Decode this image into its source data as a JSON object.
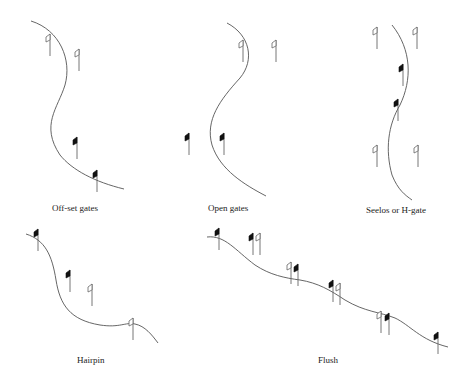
{
  "figure": {
    "panels": [
      {
        "id": "offset",
        "caption": "Off-set gates"
      },
      {
        "id": "open",
        "caption": "Open gates"
      },
      {
        "id": "seelos",
        "caption": "Seelos or H-gate"
      },
      {
        "id": "hairpin",
        "caption": "Hairpin"
      },
      {
        "id": "flush",
        "caption": "Flush"
      }
    ],
    "legend": {
      "open_flag": "outlined flag",
      "solid_flag": "black flag"
    },
    "colors": {
      "line": "#555555",
      "solid_flag": "#111111",
      "background": "#ffffff"
    }
  }
}
